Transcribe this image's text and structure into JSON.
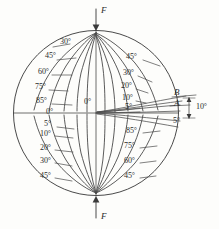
{
  "figure": {
    "type": "isoclinic-fringe-diagram",
    "line_color": "#4a4a4a",
    "background": "#fdfdfb",
    "circle": {
      "cx": 96,
      "cy": 113,
      "r": 82
    },
    "force_labels": {
      "top": "F",
      "bottom": "F"
    },
    "axis_labels": {
      "vertical_center": "0°",
      "horizontal_center": "0°"
    },
    "detail_labels": {
      "point_b": "B",
      "point_a": "A",
      "gap_angle": "10°",
      "edge_angle": "5°"
    },
    "quadrant_labels": {
      "upper_left": [
        "30°",
        "45°",
        "60°",
        "75°",
        "85°"
      ],
      "upper_right": [
        "45°",
        "30°",
        "20°",
        "10°",
        "5°"
      ],
      "lower_left": [
        "5°",
        "10°",
        "20°",
        "30°",
        "45°"
      ],
      "lower_right": [
        "85°",
        "75°",
        "60°",
        "45°"
      ]
    }
  },
  "labels": {
    "f_top": "F",
    "f_bottom": "F",
    "v0": "0°",
    "h0": "0°",
    "ul_30": "30°",
    "ul_45": "45°",
    "ul_60": "60°",
    "ul_75": "75°",
    "ul_85": "85°",
    "ur_45": "45°",
    "ur_30": "30°",
    "ur_20": "20°",
    "ur_10": "10°",
    "ur_5": "5°",
    "ll_5": "5°",
    "ll_10": "10°",
    "ll_20": "20°",
    "ll_30": "30°",
    "ll_45": "45°",
    "lr_85": "85°",
    "lr_75": "75°",
    "lr_60": "60°",
    "lr_45": "45°",
    "pt_b": "B",
    "pt_a": "A",
    "det_10": "10°",
    "det_5": "5°"
  }
}
